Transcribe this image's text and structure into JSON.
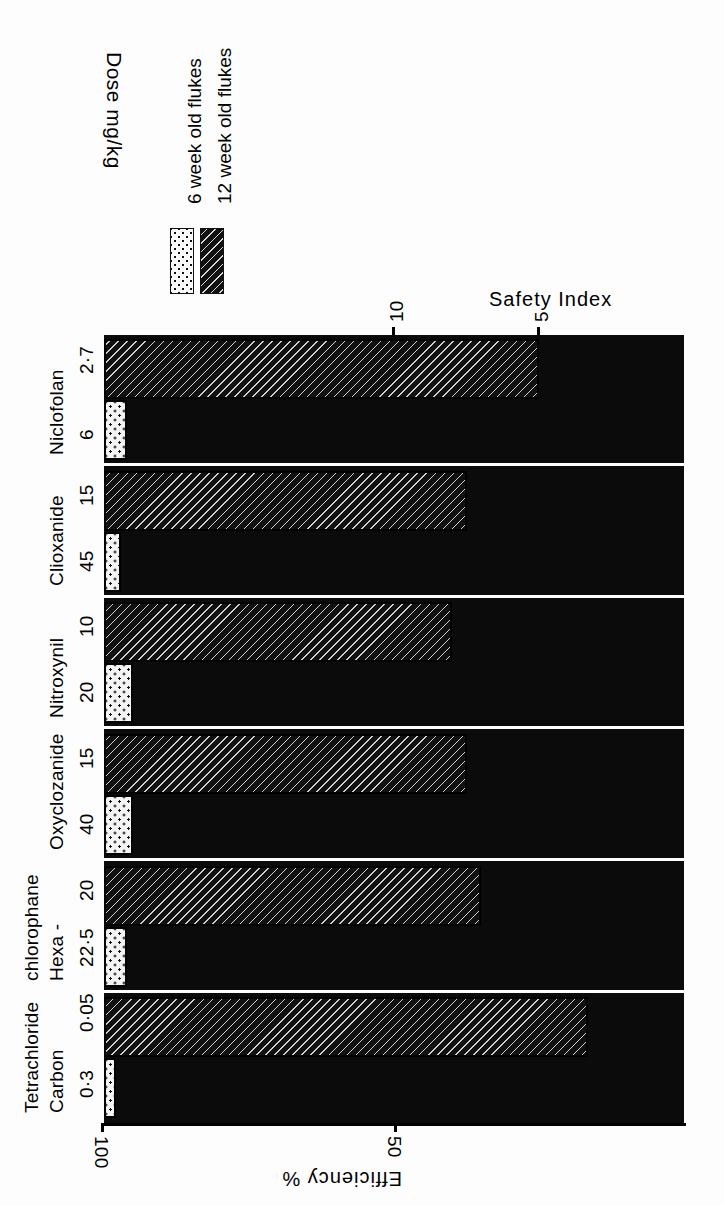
{
  "figure": {
    "orientation": "rotated-90-clockwise",
    "background": "#ffffff",
    "plot_background": "#0b0b0b"
  },
  "legend": {
    "title": "Dose mg/kg",
    "entries": [
      {
        "label": "6 week old flukes",
        "pattern": "dotted"
      },
      {
        "label": "12 week old flukes",
        "pattern": "hatched"
      }
    ]
  },
  "axes": {
    "efficiency": {
      "title": "Efficiency %",
      "ticks": [
        "100",
        "50"
      ]
    },
    "safety": {
      "title": "Safety Index",
      "ticks": [
        "10",
        "5"
      ]
    }
  },
  "groups": [
    {
      "drug": "Niclofolan",
      "drug_lines": [
        "Niclofolan"
      ],
      "dose_12wk": "2·7",
      "dose_6wk": "6"
    },
    {
      "drug": "Clioxanide",
      "drug_lines": [
        "Clioxanide"
      ],
      "dose_12wk": "15",
      "dose_6wk": "45"
    },
    {
      "drug": "Nitroxynil",
      "drug_lines": [
        "Nitroxynil"
      ],
      "dose_12wk": "10",
      "dose_6wk": "20"
    },
    {
      "drug": "Oxyclozanide",
      "drug_lines": [
        "Oxyclozanide"
      ],
      "dose_12wk": "15",
      "dose_6wk": "40"
    },
    {
      "drug": "Hexachlorophane",
      "drug_lines": [
        "Hexa -",
        "chlorophane"
      ],
      "dose_12wk": "20",
      "dose_6wk": "22·5"
    },
    {
      "drug": "Carbon Tetrachloride",
      "drug_lines": [
        "Carbon",
        "Tetrachloride"
      ],
      "dose_12wk": "0·05",
      "dose_6wk": "0·3"
    }
  ],
  "chart_data": {
    "type": "bar",
    "title": "",
    "orientation": "horizontal-grouped",
    "categories": [
      "Niclofolan",
      "Clioxanide",
      "Nitroxynil",
      "Oxyclozanide",
      "Hexachlorophane",
      "Carbon Tetrachloride"
    ],
    "doses_mg_per_kg": {
      "6_week_old_flukes": [
        "6",
        "45",
        "20",
        "40",
        "22.5",
        "0.3"
      ],
      "12_week_old_flukes": [
        "2.7",
        "15",
        "10",
        "15",
        "20",
        "0.05"
      ]
    },
    "series": [
      {
        "name": "6 week old flukes",
        "pattern": "dotted",
        "axis": "Efficiency %",
        "unit": "%",
        "values": [
          96,
          97,
          95,
          95,
          96,
          98
        ]
      },
      {
        "name": "12 week old flukes",
        "pattern": "hatched",
        "axis": "Safety Index",
        "unit": "index",
        "values": [
          5.0,
          7.5,
          8.0,
          7.5,
          7.0,
          3.3
        ]
      }
    ],
    "xlabel": "Efficiency %",
    "xlabel_secondary": "Safety Index",
    "ylabel": "Dose mg/kg",
    "efficiency_axis": {
      "ticks": [
        100,
        50
      ],
      "direction": "100 at origin, decreasing"
    },
    "safety_axis": {
      "ticks": [
        10,
        5
      ],
      "direction": "20 at origin, decreasing to 0"
    },
    "grid": false,
    "legend_position": "top-left"
  }
}
